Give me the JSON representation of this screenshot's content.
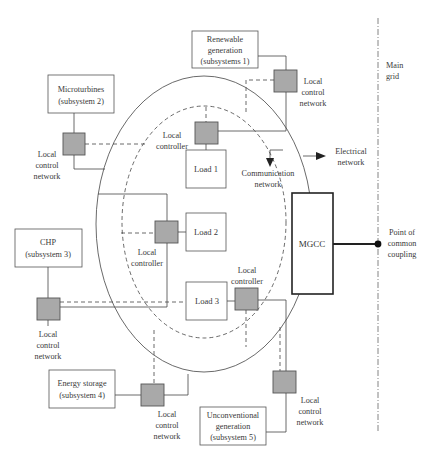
{
  "diagram": {
    "subsystems": [
      {
        "id": "s1",
        "line1": "Renewable",
        "line2": "generation",
        "line3": "(subsystems 1)"
      },
      {
        "id": "s2",
        "line1": "Microturbines",
        "line2": "(subsystem 2)"
      },
      {
        "id": "s3",
        "line1": "CHP",
        "line2": "(subsystem 3)"
      },
      {
        "id": "s4",
        "line1": "Energy storage",
        "line2": "(subsystem 4)"
      },
      {
        "id": "s5",
        "line1": "Unconventional",
        "line2": "generation",
        "line3": "(subsystem 5)"
      }
    ],
    "loads": [
      {
        "label": "Load 1"
      },
      {
        "label": "Load 2"
      },
      {
        "label": "Load 3"
      }
    ],
    "mgcc": {
      "label": "MGCC"
    },
    "local_control_network": {
      "line1": "Local",
      "line2": "control",
      "line3": "network"
    },
    "local_controller": {
      "line1": "Local",
      "line2": "controller"
    },
    "electrical_network": {
      "line1": "Electrical",
      "line2": "network"
    },
    "communication_network": {
      "line1": "Communication",
      "line2": "network"
    },
    "main_grid": {
      "line1": "Main",
      "line2": "grid"
    },
    "pcc": {
      "line1": "Point of",
      "line2": "common",
      "line3": "coupling"
    },
    "colors": {
      "controller_fill": "#a9a9a9",
      "line": "#444444",
      "text": "#3a3a3a"
    }
  }
}
